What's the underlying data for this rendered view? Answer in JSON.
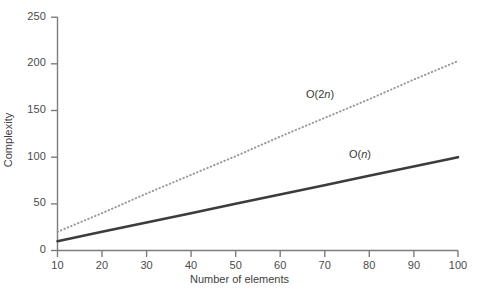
{
  "chart_data": {
    "type": "line",
    "title": "",
    "xlabel": "Number of elements",
    "ylabel": "Complexity",
    "xlim": [
      10,
      100
    ],
    "ylim": [
      0,
      250
    ],
    "xticks": [
      10,
      20,
      30,
      40,
      50,
      60,
      70,
      80,
      90,
      100
    ],
    "yticks": [
      0,
      50,
      100,
      150,
      200,
      250
    ],
    "xtick_labels": [
      "10",
      "20",
      "30",
      "40",
      "50",
      "60",
      "70",
      "80",
      "90",
      "100"
    ],
    "ytick_labels": [
      "0",
      "50",
      "100",
      "150",
      "200",
      "250"
    ],
    "grid": false,
    "legend_position": "inline-annotation",
    "x": [
      10,
      20,
      30,
      40,
      50,
      60,
      70,
      80,
      90,
      100
    ],
    "series": [
      {
        "name": "O(2n)",
        "label_prefix": "O(2",
        "label_italic": "n",
        "label_suffix": ")",
        "style": "dotted",
        "color": "#9a9a9a",
        "width": 2,
        "values": [
          20,
          40,
          61,
          81,
          101,
          122,
          142,
          162,
          183,
          203
        ]
      },
      {
        "name": "O(n)",
        "label_prefix": "O(",
        "label_italic": "n",
        "label_suffix": ")",
        "style": "solid",
        "color": "#3c3c3c",
        "width": 2.6,
        "values": [
          10,
          20,
          30,
          40,
          50,
          60,
          70,
          80,
          90,
          100
        ]
      }
    ],
    "axis_color": "#7d7d7d",
    "background": "#ffffff",
    "annotations": [
      {
        "text": "O(2n)",
        "x": 57,
        "y": 112
      },
      {
        "text": "O(n)",
        "x": 78,
        "y": 78
      }
    ]
  },
  "artifacts": {
    "bleed_through_note": "faint reverse-page show-through",
    "lines": [
      "",
      "",
      ""
    ]
  }
}
